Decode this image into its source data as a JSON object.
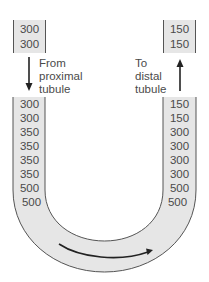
{
  "diagram": {
    "inflow": {
      "values": [
        "300",
        "300"
      ],
      "label_line1": "From",
      "label_line2": "proximal",
      "label_line3": "tubule",
      "arrow_direction": "down"
    },
    "outflow": {
      "values": [
        "150",
        "150"
      ],
      "label_line1": "To",
      "label_line2": "distal",
      "label_line3": "tubule",
      "arrow_direction": "up"
    },
    "descending_limb": {
      "values": [
        "300",
        "300",
        "350",
        "350",
        "350",
        "350",
        "500",
        "500"
      ]
    },
    "ascending_limb": {
      "values": [
        "150",
        "150",
        "300",
        "300",
        "300",
        "300",
        "500",
        "500"
      ]
    },
    "flow_arrow": "left-to-right around loop bottom",
    "colors": {
      "tube_fill": "#e6e6e6",
      "outline": "#555555",
      "text": "#4a4a4a",
      "arrow": "#222222"
    }
  }
}
